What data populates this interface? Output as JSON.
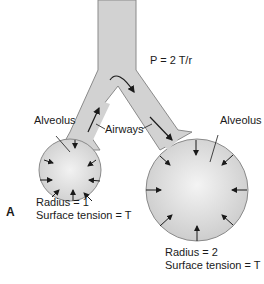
{
  "figure": {
    "panel_letter": "A",
    "equation": "P = 2 T/r",
    "airways_label": "Airways",
    "alveolus_small": {
      "label": "Alveolus",
      "radius_text": "Radius = 1",
      "tension_text": "Surface tension = T"
    },
    "alveolus_large": {
      "label": "Alveolus",
      "radius_text": "Radius = 2",
      "tension_text": "Surface tension = T"
    },
    "colors": {
      "fill": "#d2d2d2",
      "fill_center": "#f0f0f0",
      "outline": "#8a8a8a",
      "arrow": "#1a1a1a"
    }
  }
}
